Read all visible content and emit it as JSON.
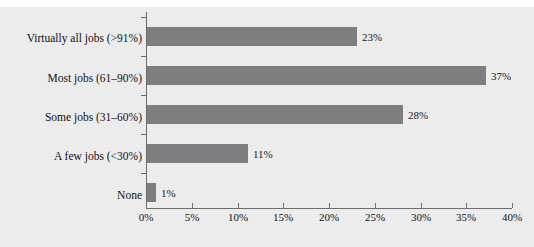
{
  "figure": {
    "background_color": "#ececed",
    "bar_color": "#7e7e80",
    "axis_color": "#6d6d6f",
    "text_color": "#111111",
    "top_clipped_text": " "
  },
  "chart_data": {
    "type": "bar",
    "orientation": "horizontal",
    "title": "",
    "subtitle": "",
    "xlabel": "",
    "ylabel": "",
    "categories": [
      "Virtually all jobs (>91%)",
      "Most jobs (61–90%)",
      "Some jobs (31–60%)",
      "A few jobs (<30%)",
      "None"
    ],
    "values": [
      23,
      37,
      28,
      11,
      1
    ],
    "data_labels": [
      "23%",
      "37%",
      "28%",
      "11%",
      "1%"
    ],
    "xlim": [
      0,
      40
    ],
    "xtick_values": [
      0,
      5,
      10,
      15,
      20,
      25,
      30,
      35,
      40
    ],
    "xtick_labels": [
      "0%",
      "5%",
      "10%",
      "15%",
      "20%",
      "25%",
      "30%",
      "35%",
      "40%"
    ],
    "grid": false,
    "legend": null,
    "value_unit": "%"
  }
}
